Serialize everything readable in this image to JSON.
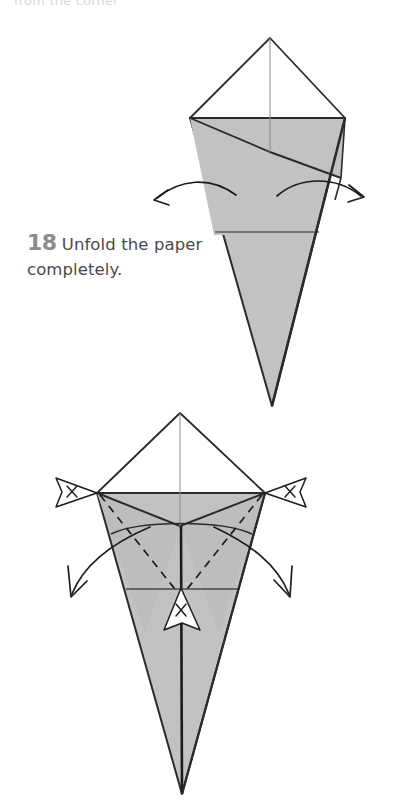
{
  "page": {
    "background_color": "#ffffff",
    "width": 407,
    "height": 810,
    "cut_off_header_text": "from the corner"
  },
  "caption": {
    "step_number": "18",
    "instruction": "Unfold the paper completely.",
    "number_color": "#8c8c8c",
    "text_color": "#4a4a4a"
  },
  "style": {
    "paper_gray": "#c2c2c2",
    "paper_gray_dark": "#b6b6b6",
    "paper_white": "#ffffff",
    "outline_color": "#2b2b2b",
    "crease_color": "#5a5a5a",
    "thin_crease_color": "#8d8d8d",
    "arrow_color": "#1c1c1c",
    "dashed_color": "#1c1c1c"
  },
  "figures": [
    {
      "id": "figure-top",
      "name": "step-18-before-unfold",
      "description": "Kite / cone model seen from the front: white diamond top, gray folded cone body with two overlapping flaps, a horizontal crease low on the cone, and two curved arrows sweeping outward to the left and right indicating the unfolding motion.",
      "parts": [
        {
          "name": "top-white-diamond",
          "fill": "white"
        },
        {
          "name": "left-gray-flap",
          "fill": "gray"
        },
        {
          "name": "right-gray-flap",
          "fill": "gray"
        },
        {
          "name": "lower-gray-cone",
          "fill": "gray"
        },
        {
          "name": "vertical-center-crease",
          "kind": "thin-line"
        },
        {
          "name": "horizontal-crease",
          "kind": "thin-line"
        }
      ],
      "arrows": [
        {
          "name": "unfold-arrow-left",
          "direction": "outward-left",
          "head": "open-v"
        },
        {
          "name": "unfold-arrow-right",
          "direction": "outward-right",
          "head": "open-v"
        }
      ]
    },
    {
      "id": "figure-bottom",
      "name": "step-18-unfolding-result",
      "description": "Same model with the side flaps being pulled open: dashed valley-fold creases run from the two upper side corners down to the center, two curved arrows sweep down and outward, three X-marked pennant pointers mark the left corner, the right corner and the center point of the cone.",
      "parts": [
        {
          "name": "top-white-diamond",
          "fill": "white"
        },
        {
          "name": "left-gray-wing",
          "fill": "gray"
        },
        {
          "name": "right-gray-wing",
          "fill": "gray"
        },
        {
          "name": "lower-gray-cone",
          "fill": "gray"
        },
        {
          "name": "vertical-center-crease",
          "kind": "bold-line"
        },
        {
          "name": "horizontal-crease",
          "kind": "thin-line"
        },
        {
          "name": "dashed-crease-left",
          "kind": "dashed"
        },
        {
          "name": "dashed-crease-right",
          "kind": "dashed"
        },
        {
          "name": "curved-rim-crease",
          "kind": "thin-curve"
        }
      ],
      "arrows": [
        {
          "name": "unfold-arrow-left",
          "direction": "down-left",
          "head": "open-v"
        },
        {
          "name": "unfold-arrow-right",
          "direction": "down-right",
          "head": "open-v"
        }
      ],
      "markers": [
        {
          "name": "x-marker-left-corner",
          "label": "X",
          "points": "right"
        },
        {
          "name": "x-marker-right-corner",
          "label": "X",
          "points": "left"
        },
        {
          "name": "x-marker-center-point",
          "label": "X",
          "points": "up"
        }
      ]
    }
  ]
}
